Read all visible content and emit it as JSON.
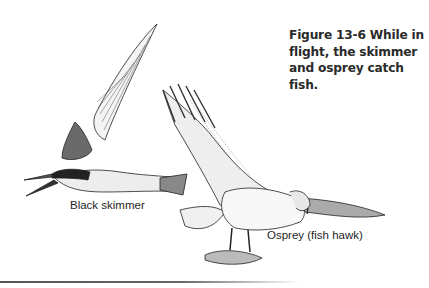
{
  "figure": {
    "number": "Figure 13-6",
    "caption_lines": [
      "While in",
      "flight, the skimmer",
      "and osprey catch fish."
    ],
    "caption_full": "Figure 13-6 While in flight, the skimmer and osprey catch fish."
  },
  "illustrations": [
    {
      "name": "black-skimmer",
      "label": "Black skimmer"
    },
    {
      "name": "osprey",
      "label": "Osprey (fish hawk)"
    }
  ],
  "colors": {
    "ink": "#1e1e1e",
    "background": "#ffffff",
    "rule": "#555555"
  }
}
